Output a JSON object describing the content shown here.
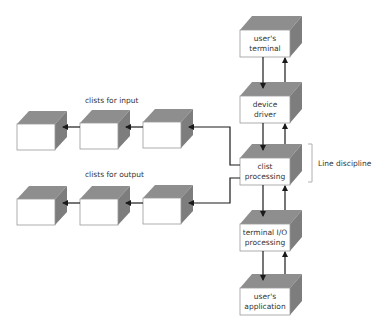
{
  "diagram": {
    "stack_boxes": [
      {
        "id": "users-terminal",
        "line1": "user's",
        "line2": "terminal"
      },
      {
        "id": "device-driver",
        "line1": "device",
        "line2": "driver"
      },
      {
        "id": "clist-processing",
        "line1": "clist",
        "line2": "processing"
      },
      {
        "id": "terminal-io-processing",
        "line1": "terminal I/O",
        "line2": "processing"
      },
      {
        "id": "users-application",
        "line1": "user's",
        "line2": "application"
      }
    ],
    "input_group_label": "clists for input",
    "output_group_label": "clists for output",
    "bracket_label": "Line discipline",
    "colors": {
      "box_shade": "#8e8e8e",
      "box_face": "#ffffff",
      "arrow": "#1a1a1a"
    }
  }
}
